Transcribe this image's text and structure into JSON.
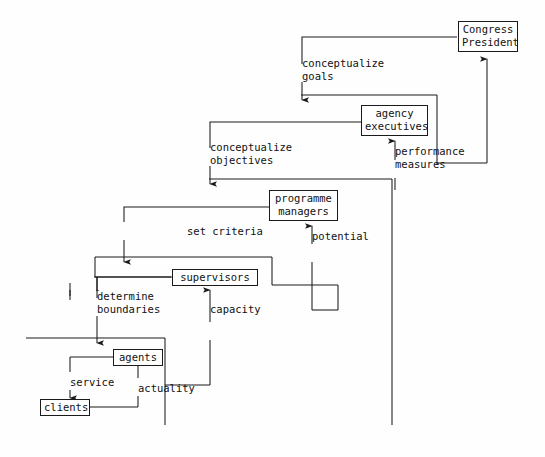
{
  "diagram": {
    "stroke_color": "#1a1a1a",
    "background_color": "#fefefe",
    "nodes": [
      {
        "id": "congress_president",
        "lines": [
          "Congress",
          "President"
        ]
      },
      {
        "id": "agency_executives",
        "lines": [
          "agency",
          "executives"
        ]
      },
      {
        "id": "programme_managers",
        "lines": [
          "programme",
          "managers"
        ]
      },
      {
        "id": "supervisors",
        "lines": [
          "supervisors"
        ]
      },
      {
        "id": "agents",
        "lines": [
          "agents"
        ]
      },
      {
        "id": "clients",
        "lines": [
          "clients"
        ]
      }
    ],
    "edge_labels": [
      {
        "id": "conceptualize_goals",
        "lines": [
          "conceptualize",
          "goals"
        ]
      },
      {
        "id": "performance_measures",
        "lines": [
          "performance",
          "measures"
        ]
      },
      {
        "id": "conceptualize_objectives",
        "lines": [
          "conceptualize",
          "objectives"
        ]
      },
      {
        "id": "potential",
        "lines": [
          "potential"
        ]
      },
      {
        "id": "set_criteria",
        "lines": [
          "set criteria"
        ]
      },
      {
        "id": "capacity",
        "lines": [
          "capacity"
        ]
      },
      {
        "id": "determine_boundaries",
        "lines": [
          "determine",
          "boundaries"
        ]
      },
      {
        "id": "actuality",
        "lines": [
          "actuality"
        ]
      },
      {
        "id": "service",
        "lines": [
          "service"
        ]
      }
    ]
  }
}
